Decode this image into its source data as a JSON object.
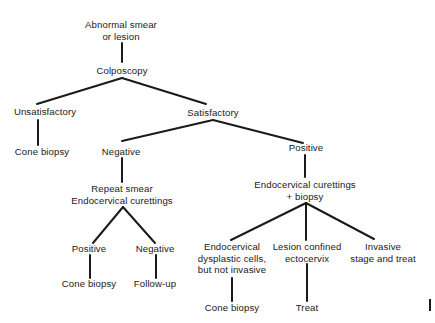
{
  "diagram": {
    "type": "decision-tree",
    "nodes": {
      "root": {
        "lines": [
          "Abnormal smear",
          "or lesion"
        ]
      },
      "colposcopy": {
        "lines": [
          "Colposcopy"
        ]
      },
      "unsatisfactory": {
        "lines": [
          "Unsatisfactory"
        ]
      },
      "unsatisfactory_cone": {
        "lines": [
          "Cone biopsy"
        ]
      },
      "satisfactory": {
        "lines": [
          "Satisfactory"
        ]
      },
      "negative": {
        "lines": [
          "Negative"
        ]
      },
      "repeat_smear": {
        "lines": [
          "Repeat smear",
          "Endocervical curettings"
        ]
      },
      "repeat_positive": {
        "lines": [
          "Positive"
        ]
      },
      "repeat_positive_cone": {
        "lines": [
          "Cone biopsy"
        ]
      },
      "repeat_negative": {
        "lines": [
          "Negative"
        ]
      },
      "repeat_negative_followup": {
        "lines": [
          "Follow-up"
        ]
      },
      "positive": {
        "lines": [
          "Positive"
        ]
      },
      "ecc_biopsy": {
        "lines": [
          "Endocervical curettings",
          "+ biopsy"
        ]
      },
      "endocervical_dysplastic": {
        "lines": [
          "Endocervical",
          "dysplastic cells,",
          "but not invasive"
        ]
      },
      "endocervical_cone": {
        "lines": [
          "Cone biopsy"
        ]
      },
      "lesion_confined": {
        "lines": [
          "Lesion confined",
          "ectocervix"
        ]
      },
      "lesion_treat": {
        "lines": [
          "Treat"
        ]
      },
      "invasive": {
        "lines": [
          "Invasive",
          "stage and treat"
        ]
      }
    },
    "edges": [
      [
        "root",
        "colposcopy"
      ],
      [
        "colposcopy",
        "unsatisfactory"
      ],
      [
        "colposcopy",
        "satisfactory"
      ],
      [
        "unsatisfactory",
        "unsatisfactory_cone"
      ],
      [
        "satisfactory",
        "negative"
      ],
      [
        "satisfactory",
        "positive"
      ],
      [
        "negative",
        "repeat_smear"
      ],
      [
        "repeat_smear",
        "repeat_positive"
      ],
      [
        "repeat_smear",
        "repeat_negative"
      ],
      [
        "repeat_positive",
        "repeat_positive_cone"
      ],
      [
        "repeat_negative",
        "repeat_negative_followup"
      ],
      [
        "positive",
        "ecc_biopsy"
      ],
      [
        "ecc_biopsy",
        "endocervical_dysplastic"
      ],
      [
        "ecc_biopsy",
        "lesion_confined"
      ],
      [
        "ecc_biopsy",
        "invasive"
      ],
      [
        "endocervical_dysplastic",
        "endocervical_cone"
      ],
      [
        "lesion_confined",
        "lesion_treat"
      ]
    ],
    "line_color": "#1a1a1a",
    "background": "#ffffff"
  }
}
